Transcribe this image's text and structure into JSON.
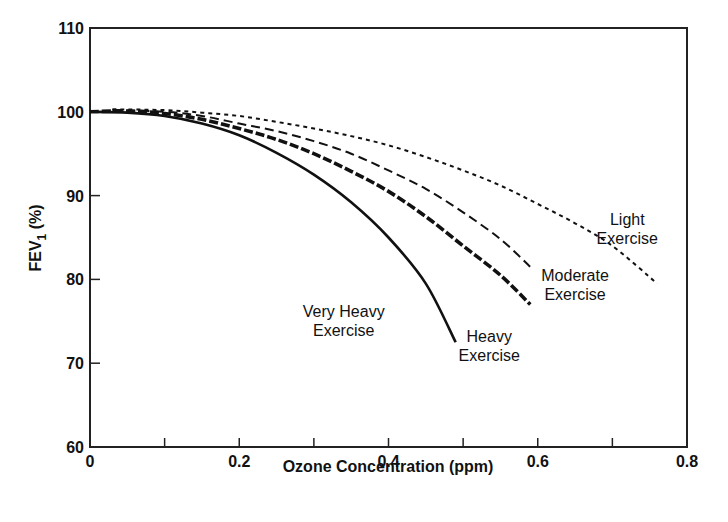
{
  "chart_data": {
    "type": "line",
    "title": "",
    "xlabel": "Ozone Concentration (ppm)",
    "ylabel": "FEV1 (%)",
    "ylabel_main": "FEV",
    "ylabel_sub": "1",
    "ylabel_suffix": " (%)",
    "xlim": [
      0,
      0.8
    ],
    "ylim": [
      60,
      110
    ],
    "x_ticks": [
      0,
      0.1,
      0.2,
      0.3,
      0.4,
      0.5,
      0.6,
      0.7,
      0.8
    ],
    "x_tick_labels": [
      {
        "value": 0,
        "label": "0"
      },
      {
        "value": 0.2,
        "label": "0.2"
      },
      {
        "value": 0.4,
        "label": "0.4"
      },
      {
        "value": 0.6,
        "label": "0.6"
      },
      {
        "value": 0.8,
        "label": "0.8"
      }
    ],
    "y_ticks": [
      60,
      70,
      80,
      90,
      100,
      110
    ],
    "y_tick_labels": [
      "60",
      "70",
      "80",
      "90",
      "100",
      "110"
    ],
    "grid": false,
    "legend": "none (curves labeled directly)",
    "series": [
      {
        "name": "Very Heavy Exercise",
        "style": "solid",
        "x": [
          0,
          0.05,
          0.1,
          0.15,
          0.2,
          0.25,
          0.3,
          0.35,
          0.4,
          0.45,
          0.49
        ],
        "y": [
          100,
          99.9,
          99.5,
          98.6,
          97.2,
          95.1,
          92.5,
          89.2,
          85.0,
          79.5,
          72.5
        ]
      },
      {
        "name": "Heavy Exercise",
        "style": "thick-dashed",
        "x": [
          0,
          0.05,
          0.1,
          0.15,
          0.2,
          0.25,
          0.3,
          0.35,
          0.4,
          0.45,
          0.5,
          0.55,
          0.59
        ],
        "y": [
          100,
          100.1,
          99.8,
          99.1,
          98.0,
          96.7,
          95.0,
          92.9,
          90.5,
          87.5,
          84.0,
          80.5,
          77.0
        ]
      },
      {
        "name": "Moderate Exercise",
        "style": "dashed",
        "x": [
          0.03,
          0.1,
          0.15,
          0.2,
          0.25,
          0.3,
          0.35,
          0.4,
          0.45,
          0.5,
          0.55,
          0.59
        ],
        "y": [
          100.2,
          100.0,
          99.5,
          98.6,
          97.7,
          96.5,
          95.0,
          93.0,
          90.8,
          88.0,
          84.8,
          81.5
        ]
      },
      {
        "name": "Light Exercise",
        "style": "dotted",
        "x": [
          0.03,
          0.1,
          0.15,
          0.2,
          0.25,
          0.3,
          0.35,
          0.4,
          0.45,
          0.5,
          0.55,
          0.6,
          0.65,
          0.7,
          0.76
        ],
        "y": [
          100.3,
          100.2,
          99.9,
          99.5,
          98.8,
          98.0,
          97.1,
          96.0,
          94.6,
          93.0,
          91.2,
          89.0,
          86.7,
          84.0,
          79.5
        ]
      }
    ],
    "annotations": [
      {
        "lines": [
          "Very Heavy",
          "Exercise"
        ],
        "x": 0.34,
        "y": 75.5
      },
      {
        "lines": [
          "Heavy",
          "Exercise"
        ],
        "x": 0.535,
        "y": 72.5
      },
      {
        "lines": [
          "Moderate",
          "Exercise"
        ],
        "x": 0.65,
        "y": 79.8
      },
      {
        "lines": [
          "Light",
          "Exercise"
        ],
        "x": 0.72,
        "y": 86.5
      }
    ]
  }
}
